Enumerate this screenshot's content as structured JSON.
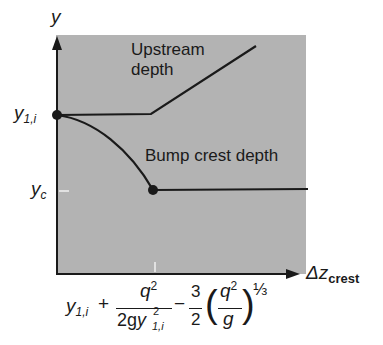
{
  "figure": {
    "background_color": "#b3b3b3",
    "line_color": "#1a1a1a",
    "tick_color": "#f0f0f0",
    "y_axis": {
      "label": "y"
    },
    "x_axis": {
      "label_main": "Δz",
      "label_sub": "crest"
    },
    "y_ticks": [
      {
        "main": "y",
        "sub": "1,i"
      },
      {
        "main": "y",
        "sub": "c"
      }
    ],
    "curves": [
      {
        "name": "upstream-depth",
        "label_line1": "Upstream",
        "label_line2": "depth"
      },
      {
        "name": "bump-crest-depth",
        "label": "Bump crest depth"
      }
    ],
    "x_tick_formula": {
      "term1_main": "y",
      "term1_sub": "1,i",
      "plus": "+",
      "frac1_num": "q",
      "frac1_num_exp": "2",
      "frac1_den_coef": "2g",
      "frac1_den_var": "y",
      "frac1_den_exp": "2",
      "frac1_den_sub": "1,i",
      "minus": "−",
      "frac2_num": "3",
      "frac2_den": "2",
      "paren_open": "(",
      "frac3_num": "q",
      "frac3_num_exp": "2",
      "frac3_den": "g",
      "paren_close": ")",
      "exponent": "⅓"
    }
  }
}
